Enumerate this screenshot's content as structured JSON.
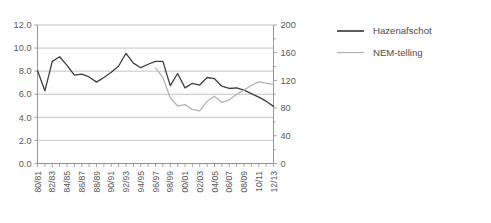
{
  "chart_data": {
    "type": "line",
    "title": "",
    "subtitle": "",
    "xlabel": "",
    "ylabel": "",
    "grid": true,
    "legend_position": "right",
    "categories": [
      "80/81",
      "81/82",
      "82/83",
      "83/84",
      "84/85",
      "85/86",
      "86/87",
      "87/88",
      "88/89",
      "89/90",
      "90/91",
      "91/92",
      "92/93",
      "93/94",
      "94/95",
      "95/96",
      "96/97",
      "97/98",
      "98/99",
      "99/00",
      "00/01",
      "01/02",
      "02/03",
      "03/04",
      "04/05",
      "05/06",
      "06/07",
      "07/08",
      "08/09",
      "09/10",
      "10/11",
      "11/12",
      "12/13"
    ],
    "x_tick_labels": [
      "80/81",
      "82/83",
      "84/85",
      "86/87",
      "88/89",
      "90/91",
      "92/93",
      "94/95",
      "96/97",
      "98/99",
      "00/01",
      "02/03",
      "04/05",
      "06/07",
      "08/09",
      "10/11",
      "12/13"
    ],
    "axes": {
      "left": {
        "label": "",
        "min": 0.0,
        "max": 12.0,
        "step": 2.0,
        "ticks": [
          "0.0",
          "2.0",
          "4.0",
          "6.0",
          "8.0",
          "10.0",
          "12.0"
        ]
      },
      "right": {
        "label": "",
        "min": 0,
        "max": 200,
        "step": 40,
        "ticks": [
          "0",
          "40",
          "80",
          "120",
          "160",
          "200"
        ]
      }
    },
    "series": [
      {
        "name": "Hazenafschot",
        "axis": "left",
        "color": "#3f3f3f",
        "width": 1.3,
        "values": [
          8.05,
          6.3,
          8.85,
          9.25,
          8.5,
          7.65,
          7.75,
          7.5,
          7.05,
          7.45,
          7.9,
          8.45,
          9.55,
          8.7,
          8.3,
          8.6,
          8.85,
          8.85,
          6.75,
          7.8,
          6.55,
          6.95,
          6.8,
          7.45,
          7.35,
          6.7,
          6.5,
          6.55,
          6.35,
          6.05,
          5.75,
          5.4,
          4.95
        ]
      },
      {
        "name": "NEM-telling",
        "axis": "right",
        "color": "#b3b3b3",
        "width": 1.3,
        "values": [
          null,
          null,
          null,
          null,
          null,
          null,
          null,
          null,
          null,
          null,
          null,
          null,
          null,
          null,
          null,
          null,
          138,
          124,
          95,
          83,
          85,
          78,
          76,
          90,
          97,
          88,
          92,
          100,
          106,
          113,
          118,
          116,
          114
        ]
      }
    ],
    "legend": [
      {
        "label": "Hazenafschot",
        "color": "#3f3f3f"
      },
      {
        "label": "NEM-telling",
        "color": "#b3b3b3"
      }
    ],
    "colors": {
      "hazenafschot": "#3f3f3f",
      "nem_telling": "#b3b3b3",
      "gridline": "#b5b5b5",
      "axis": "#8c8c8c",
      "text": "#5a5a5a",
      "background": "#ffffff"
    }
  }
}
